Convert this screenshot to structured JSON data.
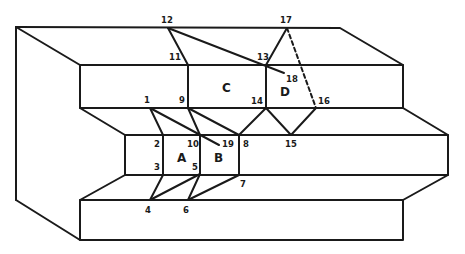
{
  "diagram": {
    "type": "block-diagram-folded-step",
    "stroke_color": "#1a1a1a",
    "background": "#ffffff",
    "points": [
      {
        "id": "1",
        "label": "1",
        "x": 150,
        "y": 108
      },
      {
        "id": "2",
        "label": "2",
        "x": 163,
        "y": 135
      },
      {
        "id": "3",
        "label": "3",
        "x": 163,
        "y": 175
      },
      {
        "id": "4",
        "label": "4",
        "x": 150,
        "y": 200
      },
      {
        "id": "5",
        "label": "5",
        "x": 200,
        "y": 174
      },
      {
        "id": "6",
        "label": "6",
        "x": 188,
        "y": 200
      },
      {
        "id": "7",
        "label": "7",
        "x": 239,
        "y": 175
      },
      {
        "id": "8",
        "label": "8",
        "x": 239,
        "y": 135
      },
      {
        "id": "9",
        "label": "9",
        "x": 188,
        "y": 108
      },
      {
        "id": "10",
        "label": "10",
        "x": 200,
        "y": 135
      },
      {
        "id": "11",
        "label": "11",
        "x": 188,
        "y": 65
      },
      {
        "id": "12",
        "label": "12",
        "x": 168,
        "y": 28
      },
      {
        "id": "13",
        "label": "13",
        "x": 266,
        "y": 65
      },
      {
        "id": "14",
        "label": "14",
        "x": 266,
        "y": 108
      },
      {
        "id": "15",
        "label": "15",
        "x": 291,
        "y": 135
      },
      {
        "id": "16",
        "label": "16",
        "x": 316,
        "y": 108
      },
      {
        "id": "17",
        "label": "17",
        "x": 287,
        "y": 28
      },
      {
        "id": "18",
        "label": "18",
        "x": 284,
        "y": 73
      },
      {
        "id": "19",
        "label": "19",
        "x": 219,
        "y": 145
      }
    ],
    "regions": [
      {
        "id": "A",
        "label": "A"
      },
      {
        "id": "B",
        "label": "B"
      },
      {
        "id": "C",
        "label": "C"
      },
      {
        "id": "D",
        "label": "D"
      }
    ],
    "edges": [
      {
        "from": "1",
        "to": "2"
      },
      {
        "from": "1",
        "to": "10"
      },
      {
        "from": "1",
        "to": "19"
      },
      {
        "from": "2",
        "to": "3"
      },
      {
        "from": "3",
        "to": "4"
      },
      {
        "from": "4",
        "to": "5"
      },
      {
        "from": "5",
        "to": "6"
      },
      {
        "from": "6",
        "to": "7"
      },
      {
        "from": "5",
        "to": "10"
      },
      {
        "from": "9",
        "to": "10"
      },
      {
        "from": "9",
        "to": "8"
      },
      {
        "from": "8",
        "to": "7"
      },
      {
        "from": "9",
        "to": "11"
      },
      {
        "from": "11",
        "to": "12"
      },
      {
        "from": "12",
        "to": "18"
      },
      {
        "from": "13",
        "to": "14"
      },
      {
        "from": "13",
        "to": "17"
      },
      {
        "from": "14",
        "to": "8"
      },
      {
        "from": "14",
        "to": "15"
      },
      {
        "from": "15",
        "to": "16"
      },
      {
        "from": "17",
        "to": "16",
        "style": "dashed"
      }
    ]
  },
  "labels": {
    "p1": "1",
    "p2": "2",
    "p3": "3",
    "p4": "4",
    "p5": "5",
    "p6": "6",
    "p7": "7",
    "p8": "8",
    "p9": "9",
    "p10": "10",
    "p11": "11",
    "p12": "12",
    "p13": "13",
    "p14": "14",
    "p15": "15",
    "p16": "16",
    "p17": "17",
    "p18": "18",
    "p19": "19",
    "rA": "A",
    "rB": "B",
    "rC": "C",
    "rD": "D"
  }
}
